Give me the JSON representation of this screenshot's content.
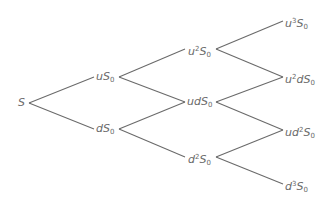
{
  "diagram": {
    "type": "binomial-tree",
    "steps": 3,
    "line_color": "#6a6a6a",
    "text_color": "#6a6a6a",
    "nodes": [
      {
        "id": "s",
        "label": "S",
        "base": "S",
        "sup": "",
        "mid": "",
        "var": "",
        "sub": "",
        "x": 18,
        "y": 97
      },
      {
        "id": "u1",
        "label": "uS0",
        "base": "u",
        "sup": "",
        "mid": "",
        "var": "S",
        "sub": "0",
        "x": 96,
        "y": 71
      },
      {
        "id": "d1",
        "label": "dS0",
        "base": "d",
        "sup": "",
        "mid": "",
        "var": "S",
        "sub": "0",
        "x": 96,
        "y": 123
      },
      {
        "id": "uu2",
        "label": "u2S0",
        "base": "u",
        "sup": "2",
        "mid": "",
        "var": "S",
        "sub": "0",
        "x": 188,
        "y": 43
      },
      {
        "id": "ud2",
        "label": "udS0",
        "base": "ud",
        "sup": "",
        "mid": "",
        "var": "S",
        "sub": "0",
        "x": 187,
        "y": 96
      },
      {
        "id": "dd2",
        "label": "d2S0",
        "base": "d",
        "sup": "2",
        "mid": "",
        "var": "S",
        "sub": "0",
        "x": 188,
        "y": 151
      },
      {
        "id": "uuu3",
        "label": "u3S0",
        "base": "u",
        "sup": "3",
        "mid": "",
        "var": "S",
        "sub": "0",
        "x": 285,
        "y": 15
      },
      {
        "id": "uud3",
        "label": "u2dS0",
        "base": "u",
        "sup": "2",
        "mid": "d",
        "var": "S",
        "sub": "0",
        "x": 285,
        "y": 71
      },
      {
        "id": "udd3",
        "label": "ud2S0",
        "base": "ud",
        "sup": "2",
        "mid": "",
        "var": "S",
        "sub": "0",
        "x": 285,
        "y": 124
      },
      {
        "id": "ddd3",
        "label": "d3S0",
        "base": "d",
        "sup": "3",
        "mid": "",
        "var": "S",
        "sub": "0",
        "x": 285,
        "y": 178
      }
    ],
    "edges": [
      {
        "from": "s",
        "to": "u1",
        "x1": 29,
        "y1": 103,
        "x2": 94,
        "y2": 77
      },
      {
        "from": "s",
        "to": "d1",
        "x1": 29,
        "y1": 103,
        "x2": 94,
        "y2": 129
      },
      {
        "from": "u1",
        "to": "uu2",
        "x1": 119,
        "y1": 77,
        "x2": 185,
        "y2": 49
      },
      {
        "from": "u1",
        "to": "ud2",
        "x1": 119,
        "y1": 77,
        "x2": 185,
        "y2": 102
      },
      {
        "from": "d1",
        "to": "ud2",
        "x1": 119,
        "y1": 129,
        "x2": 185,
        "y2": 102
      },
      {
        "from": "d1",
        "to": "dd2",
        "x1": 119,
        "y1": 129,
        "x2": 185,
        "y2": 157
      },
      {
        "from": "uu2",
        "to": "uuu3",
        "x1": 216,
        "y1": 49,
        "x2": 283,
        "y2": 21
      },
      {
        "from": "uu2",
        "to": "uud3",
        "x1": 216,
        "y1": 49,
        "x2": 283,
        "y2": 77
      },
      {
        "from": "ud2",
        "to": "uud3",
        "x1": 216,
        "y1": 102,
        "x2": 283,
        "y2": 77
      },
      {
        "from": "ud2",
        "to": "udd3",
        "x1": 216,
        "y1": 102,
        "x2": 283,
        "y2": 130
      },
      {
        "from": "dd2",
        "to": "udd3",
        "x1": 216,
        "y1": 157,
        "x2": 283,
        "y2": 130
      },
      {
        "from": "dd2",
        "to": "ddd3",
        "x1": 216,
        "y1": 157,
        "x2": 283,
        "y2": 184
      }
    ]
  }
}
